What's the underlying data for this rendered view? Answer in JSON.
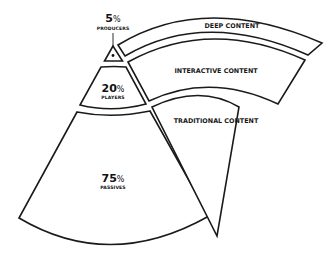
{
  "diagram": {
    "type": "audience-content-pyramid",
    "audience_segments": [
      {
        "key": "producers",
        "percent": "5",
        "percent_sign": "%",
        "label": "PRODUCERS"
      },
      {
        "key": "players",
        "percent": "20",
        "percent_sign": "%",
        "label": "PLAYERS"
      },
      {
        "key": "passives",
        "percent": "75",
        "percent_sign": "%",
        "label": "PASSIVES"
      }
    ],
    "content_bands": [
      {
        "key": "deep",
        "label": "DEEP CONTENT"
      },
      {
        "key": "interactive",
        "label": "INTERACTIVE CONTENT"
      },
      {
        "key": "traditional",
        "label": "TRADITIONAL CONTENT"
      }
    ],
    "colors": {
      "stroke": "#1a1a1a",
      "fill": "#ffffff",
      "text": "#111111"
    }
  }
}
